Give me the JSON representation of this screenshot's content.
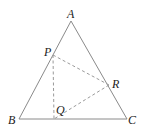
{
  "diagram": {
    "type": "geometry",
    "points": {
      "A": {
        "label": "A",
        "x": 71,
        "y": 21
      },
      "B": {
        "label": "B",
        "x": 19,
        "y": 119
      },
      "C": {
        "label": "C",
        "x": 127,
        "y": 119
      },
      "P": {
        "label": "P",
        "x": 53,
        "y": 55
      },
      "Q": {
        "label": "Q",
        "x": 54,
        "y": 119
      },
      "R": {
        "label": "R",
        "x": 109,
        "y": 85
      }
    },
    "solid_segments": [
      "AB",
      "BC",
      "CA"
    ],
    "dashed_segments": [
      "PQ",
      "PR",
      "RQ"
    ],
    "stroke_color": "#8a8a8a"
  }
}
